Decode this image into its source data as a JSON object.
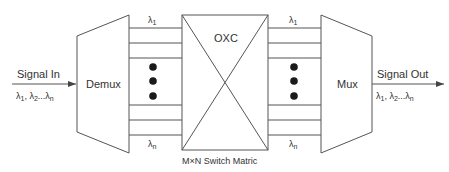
{
  "diagram": {
    "input": {
      "label": "Signal In",
      "wavelengths": "λ1, λ2...λn"
    },
    "output": {
      "label": "Signal Out",
      "wavelengths": "λ1, λ2...λn"
    },
    "demux": {
      "label": "Demux"
    },
    "mux": {
      "label": "Mux"
    },
    "oxc": {
      "label": "OXC",
      "caption": "M×N Switch Matric"
    },
    "left_channels": {
      "top_label": "λ1",
      "bottom_label": "λn"
    },
    "right_channels": {
      "top_label": "λ1",
      "bottom_label": "λn"
    },
    "colors": {
      "line": "#555555",
      "text": "#333333",
      "dot": "#1a1a1a",
      "background": "#ffffff"
    }
  }
}
